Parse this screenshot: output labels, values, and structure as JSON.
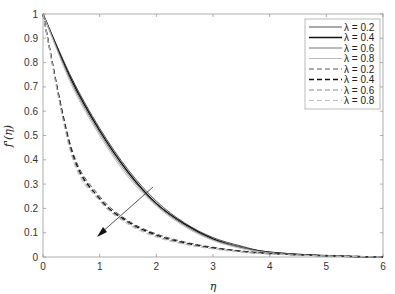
{
  "chart_data": {
    "type": "line",
    "title": "",
    "xlabel": "η",
    "ylabel": "f'(η)",
    "xlim": [
      0,
      6
    ],
    "ylim": [
      0,
      1
    ],
    "xticks": [
      "0",
      "1",
      "2",
      "3",
      "4",
      "5",
      "6"
    ],
    "yticks": [
      "0",
      "0.1",
      "0.2",
      "0.3",
      "0.4",
      "0.5",
      "0.6",
      "0.7",
      "0.8",
      "0.9",
      "1"
    ],
    "grid": false,
    "legend_position": "upper right",
    "x": [
      0,
      0.5,
      1,
      1.5,
      2,
      2.5,
      3,
      3.5,
      4,
      5,
      6
    ],
    "series": [
      {
        "name": "λ = 0.2",
        "style": "solid",
        "color": "#555555",
        "values": [
          1,
          0.74,
          0.53,
          0.36,
          0.23,
          0.14,
          0.08,
          0.045,
          0.02,
          0.005,
          0
        ]
      },
      {
        "name": "λ = 0.4",
        "style": "solid",
        "color": "#111111",
        "values": [
          1,
          0.73,
          0.52,
          0.35,
          0.22,
          0.135,
          0.075,
          0.04,
          0.02,
          0.005,
          0
        ]
      },
      {
        "name": "λ = 0.6",
        "style": "solid",
        "color": "#777777",
        "values": [
          1,
          0.72,
          0.51,
          0.34,
          0.215,
          0.13,
          0.07,
          0.04,
          0.018,
          0.004,
          0
        ]
      },
      {
        "name": "λ = 0.8",
        "style": "solid",
        "color": "#bbbbbb",
        "values": [
          1,
          0.71,
          0.5,
          0.33,
          0.21,
          0.125,
          0.068,
          0.035,
          0.017,
          0.004,
          0
        ]
      },
      {
        "name": "λ = 0.2",
        "style": "dashed",
        "color": "#555555",
        "values": [
          1,
          0.45,
          0.25,
          0.15,
          0.095,
          0.062,
          0.04,
          0.025,
          0.015,
          0.005,
          0
        ]
      },
      {
        "name": "λ = 0.4",
        "style": "dashed",
        "color": "#111111",
        "values": [
          1,
          0.44,
          0.24,
          0.145,
          0.09,
          0.058,
          0.037,
          0.023,
          0.014,
          0.005,
          0
        ]
      },
      {
        "name": "λ = 0.6",
        "style": "dashed",
        "color": "#888888",
        "values": [
          1,
          0.43,
          0.235,
          0.14,
          0.086,
          0.055,
          0.035,
          0.022,
          0.013,
          0.004,
          0
        ]
      },
      {
        "name": "λ = 0.8",
        "style": "dashed",
        "color": "#bbbbbb",
        "values": [
          1,
          0.42,
          0.23,
          0.135,
          0.082,
          0.052,
          0.033,
          0.02,
          0.012,
          0.004,
          0
        ]
      }
    ],
    "annotations": [
      {
        "type": "arrow",
        "from": [
          1.95,
          0.29
        ],
        "to": [
          1.0,
          0.09
        ],
        "meaning": "increasing λ"
      }
    ]
  }
}
